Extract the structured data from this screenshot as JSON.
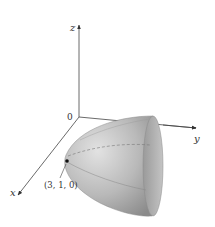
{
  "figure": {
    "type": "3d-surface-plot",
    "surface": "elliptic paraboloid opening along positive y-axis",
    "axes": {
      "x_label": "x",
      "y_label": "y",
      "z_label": "z",
      "origin_label": "0"
    },
    "point": {
      "label": "(3, 1, 0)",
      "coords": [
        3,
        1,
        0
      ]
    },
    "colors": {
      "axis": "#444444",
      "surface_light": "#d8d8d8",
      "surface_dark": "#8c8c8c",
      "rim_inner": "#a5a5a5",
      "point": "#111111"
    }
  }
}
